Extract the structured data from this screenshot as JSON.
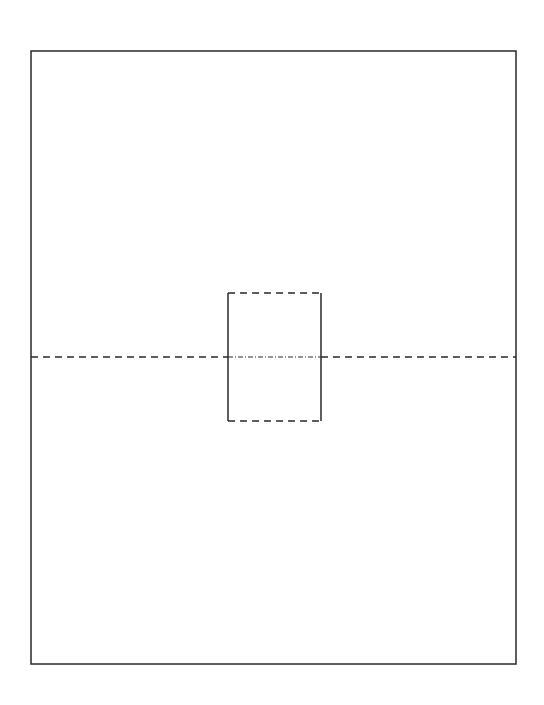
{
  "diagram": {
    "background": "#ffffff",
    "stroke_color": "#2a2a2a",
    "outer_rect": {
      "x": 31,
      "y": 51,
      "width": 485,
      "height": 613,
      "style": "solid"
    },
    "inner_rect": {
      "x": 228,
      "y": 293,
      "width": 93,
      "height": 128,
      "sides": {
        "left": "solid",
        "right": "solid",
        "top": "dashed",
        "bottom": "dashed"
      }
    },
    "center_line": {
      "y": 357,
      "x1": 31,
      "x2": 516,
      "style_outside": "dashed",
      "style_inside": "dash-dot"
    }
  }
}
